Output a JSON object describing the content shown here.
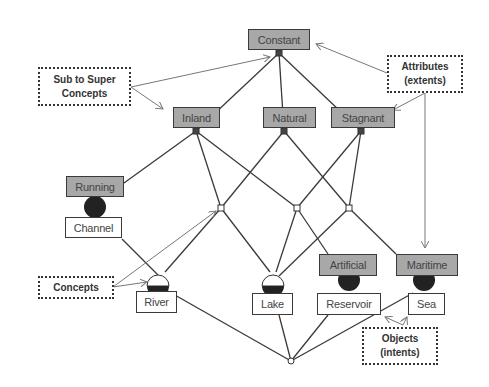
{
  "diagram": {
    "type": "concept-lattice",
    "colors": {
      "attribute_fill": "#a8a8a8",
      "object_fill": "#ffffff",
      "line": "#3a3a3a",
      "arrow": "#777777",
      "full_node": "#222222"
    },
    "attributes": [
      {
        "id": "constant",
        "label": "Constant"
      },
      {
        "id": "inland",
        "label": "Inland"
      },
      {
        "id": "natural",
        "label": "Natural"
      },
      {
        "id": "stagnant",
        "label": "Stagnant"
      },
      {
        "id": "running",
        "label": "Running"
      },
      {
        "id": "artificial",
        "label": "Artificial"
      },
      {
        "id": "maritime",
        "label": "Maritime"
      }
    ],
    "objects": [
      {
        "id": "channel",
        "label": "Channel"
      },
      {
        "id": "river",
        "label": "River"
      },
      {
        "id": "lake",
        "label": "Lake"
      },
      {
        "id": "reservoir",
        "label": "Reservoir"
      },
      {
        "id": "sea",
        "label": "Sea"
      }
    ],
    "annotations": {
      "sub_to_super": {
        "line1": "Sub to Super",
        "line2": "Concepts"
      },
      "attributes": {
        "line1": "Attributes",
        "line2": "(extents)"
      },
      "concepts": {
        "line1": "Concepts"
      },
      "objects": {
        "line1": "Objects",
        "line2": "(intents)"
      }
    },
    "edges": [
      [
        "Constant",
        "Inland"
      ],
      [
        "Constant",
        "Natural"
      ],
      [
        "Constant",
        "Stagnant"
      ],
      [
        "Inland",
        "Running"
      ],
      [
        "Inland",
        "concept-a"
      ],
      [
        "Inland",
        "concept-b"
      ],
      [
        "Natural",
        "concept-a"
      ],
      [
        "Natural",
        "concept-c"
      ],
      [
        "Stagnant",
        "concept-b"
      ],
      [
        "Stagnant",
        "concept-c"
      ],
      [
        "Running/Channel",
        "River"
      ],
      [
        "concept-a",
        "River"
      ],
      [
        "concept-a",
        "Lake"
      ],
      [
        "concept-b",
        "Lake"
      ],
      [
        "concept-b",
        "Artificial/Reservoir"
      ],
      [
        "concept-c",
        "Lake"
      ],
      [
        "concept-c",
        "Maritime/Sea"
      ],
      [
        "River",
        "bottom"
      ],
      [
        "Lake",
        "bottom"
      ],
      [
        "Reservoir",
        "bottom"
      ],
      [
        "Sea",
        "bottom"
      ]
    ]
  }
}
